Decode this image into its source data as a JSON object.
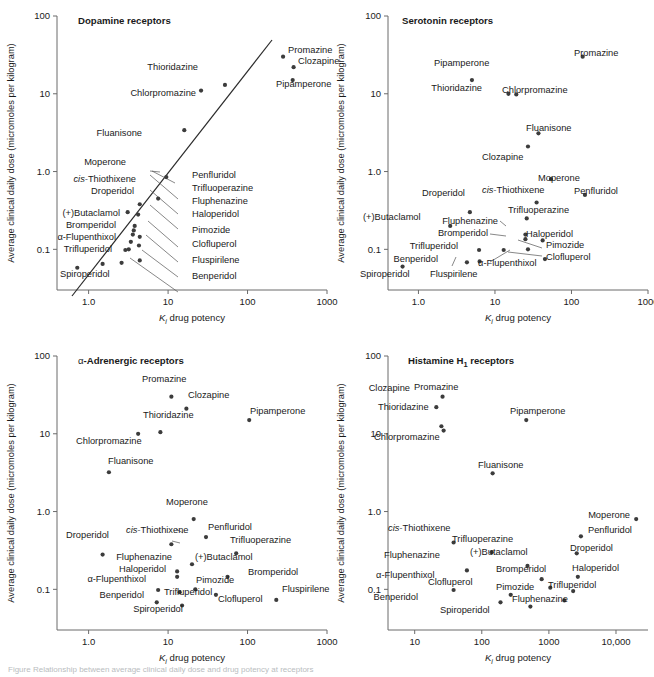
{
  "figure": {
    "axis_y_label": "Average clinical daily dose (micromoles per kilogram)",
    "axis_x_label_prefix": "K",
    "axis_x_label_sub": "i",
    "axis_x_label_suffix": " drug potency",
    "caption": "Figure   Relationship between average clinical daily dose and drug potency at receptors",
    "point_color": "#3c3c3c",
    "axis_color": "#6b6b6b",
    "text_color": "#1a1a1a"
  },
  "chart_data": [
    {
      "type": "scatter",
      "panel_id": "dopamine",
      "title": "Dopamine receptors",
      "xlabel": "Ki drug potency",
      "ylabel": "Average clinical daily dose (micromoles per kilogram)",
      "xlim": [
        0.4,
        1000
      ],
      "ylim": [
        0.03,
        100
      ],
      "xscale": "log",
      "yscale": "log",
      "xticks": [
        "1.0",
        "10",
        "100",
        "1000"
      ],
      "xtick_values": [
        1,
        10,
        100,
        1000
      ],
      "yticks": [
        "100",
        "10",
        "1.0",
        "0.1"
      ],
      "ytick_values": [
        100,
        10,
        1,
        0.1
      ],
      "grid": false,
      "has_regression_line": true,
      "regression_note": "Diagonal best-fit line from lower-left to upper-right",
      "points": [
        {
          "label": "Promazine",
          "x": 280,
          "y": 30,
          "lbl_pos": "right"
        },
        {
          "label": "Clozapine",
          "x": 380,
          "y": 22,
          "lbl_pos": "right"
        },
        {
          "label": "Pipamperone",
          "x": 370,
          "y": 15,
          "lbl_pos": "below-right"
        },
        {
          "label": "Thioridazine",
          "x": 52,
          "y": 13,
          "lbl_pos": "above-left"
        },
        {
          "label": "Chlorpromazine",
          "x": 26,
          "y": 11,
          "lbl_pos": "below-left"
        },
        {
          "label": "Fluanisone",
          "x": 16,
          "y": 3.4,
          "lbl_pos": "below-left"
        },
        {
          "label": "Moperone",
          "x": 9.5,
          "y": 0.85,
          "lbl_pos": "above-left"
        },
        {
          "label": "Penfluridol",
          "x": 7.5,
          "y": 0.45,
          "lbl_pos": "leader-right"
        },
        {
          "label": "cis-Thiothixene",
          "x": 4.4,
          "y": 0.38,
          "lbl_pos": "leader-left"
        },
        {
          "label": "Droperidol",
          "x": 4.2,
          "y": 0.28,
          "lbl_pos": "leader-left"
        },
        {
          "label": "(+)Butaclamol",
          "x": 3.1,
          "y": 0.3,
          "lbl_pos": "leader-left"
        },
        {
          "label": "Trifluoperazine",
          "x": 3.8,
          "y": 0.2,
          "lbl_pos": "leader-right"
        },
        {
          "label": "Bromperidol",
          "x": 3.7,
          "y": 0.175,
          "lbl_pos": "leader-left"
        },
        {
          "label": "Fluphenazine",
          "x": 3.6,
          "y": 0.155,
          "lbl_pos": "leader-right"
        },
        {
          "label": "Haloperidol",
          "x": 4.4,
          "y": 0.145,
          "lbl_pos": "leader-right"
        },
        {
          "label": "alpha-Flupenthixol",
          "x": 3.4,
          "y": 0.125,
          "lbl_pos": "leader-left"
        },
        {
          "label": "Pimozide",
          "x": 4.3,
          "y": 0.112,
          "lbl_pos": "leader-right"
        },
        {
          "label": "Trifluperidol",
          "x": 2.9,
          "y": 0.098,
          "lbl_pos": "leader-left"
        },
        {
          "label": "Clofluperol",
          "x": 3.2,
          "y": 0.1,
          "lbl_pos": "leader-right"
        },
        {
          "label": "Fluspirilene",
          "x": 4.4,
          "y": 0.072,
          "lbl_pos": "leader-right"
        },
        {
          "label": "Benperidol",
          "x": 2.6,
          "y": 0.067,
          "lbl_pos": "leader-right"
        },
        {
          "label": "Spiroperidol",
          "x": 0.72,
          "y": 0.058,
          "lbl_pos": "below"
        },
        {
          "label": "Fluspirilene-b",
          "x": 1.5,
          "y": 0.065,
          "lbl_pos": "none"
        }
      ]
    },
    {
      "type": "scatter",
      "panel_id": "serotonin",
      "title": "Serotonin receptors",
      "xlabel": "Ki drug potency",
      "ylabel": "Average clinical daily dose (micromoles per kilogram)",
      "xlim": [
        0.4,
        1000
      ],
      "ylim": [
        0.03,
        100
      ],
      "xscale": "log",
      "yscale": "log",
      "xticks": [
        "1.0",
        "10",
        "100",
        "1000"
      ],
      "xtick_values": [
        1,
        10,
        100,
        1000
      ],
      "yticks": [
        "100",
        "10",
        "1.0",
        "0.1"
      ],
      "ytick_values": [
        100,
        10,
        1,
        0.1
      ],
      "grid": false,
      "has_regression_line": false,
      "points": [
        {
          "label": "Promazine",
          "x": 140,
          "y": 30,
          "lbl_pos": "right"
        },
        {
          "label": "Pipamperone",
          "x": 5.0,
          "y": 15,
          "lbl_pos": "above"
        },
        {
          "label": "Thioridazine",
          "x": 15,
          "y": 10,
          "lbl_pos": "left"
        },
        {
          "label": "Chlorpromazine",
          "x": 19,
          "y": 9.8,
          "lbl_pos": "right"
        },
        {
          "label": "Fluanisone",
          "x": 37,
          "y": 3.1,
          "lbl_pos": "right"
        },
        {
          "label": "Clozapine",
          "x": 27,
          "y": 2.1,
          "lbl_pos": "below-left"
        },
        {
          "label": "Moperone",
          "x": 54,
          "y": 0.8,
          "lbl_pos": "right"
        },
        {
          "label": "Penfluridol",
          "x": 150,
          "y": 0.5,
          "lbl_pos": "right"
        },
        {
          "label": "cis-Thiothixene",
          "x": 35,
          "y": 0.4,
          "lbl_pos": "above"
        },
        {
          "label": "Droperidol",
          "x": 4.7,
          "y": 0.3,
          "lbl_pos": "above-left"
        },
        {
          "label": "Trifluoperazine",
          "x": 26,
          "y": 0.25,
          "lbl_pos": "right"
        },
        {
          "label": "(+)Butaclamol",
          "x": 2.6,
          "y": 0.2,
          "lbl_pos": "left"
        },
        {
          "label": "Fluphenazine",
          "x": 25,
          "y": 0.155,
          "lbl_pos": "leader-left"
        },
        {
          "label": "Bromperidol",
          "x": 25,
          "y": 0.135,
          "lbl_pos": "leader-left"
        },
        {
          "label": "Haloperidol",
          "x": 42,
          "y": 0.13,
          "lbl_pos": "right"
        },
        {
          "label": "Pimozide",
          "x": 27,
          "y": 0.1,
          "lbl_pos": "leader-right"
        },
        {
          "label": "Trifluperidol",
          "x": 6.2,
          "y": 0.098,
          "lbl_pos": "left"
        },
        {
          "label": "alpha-Flupenthixol",
          "x": 13,
          "y": 0.098,
          "lbl_pos": "leader-below"
        },
        {
          "label": "Clofluperol",
          "x": 45,
          "y": 0.075,
          "lbl_pos": "leader-right"
        },
        {
          "label": "Fluspirilene",
          "x": 6.3,
          "y": 0.07,
          "lbl_pos": "leader-below"
        },
        {
          "label": "Benperidol",
          "x": 4.3,
          "y": 0.068,
          "lbl_pos": "left"
        },
        {
          "label": "Spiroperidol",
          "x": 0.62,
          "y": 0.06,
          "lbl_pos": "below"
        }
      ]
    },
    {
      "type": "scatter",
      "panel_id": "alpha-adrenergic",
      "title": "α-Adrenergic receptors",
      "xlabel": "Ki drug potency",
      "ylabel": "Average clinical daily dose (micromoles per kilogram)",
      "xlim": [
        0.4,
        1000
      ],
      "ylim": [
        0.03,
        100
      ],
      "xscale": "log",
      "yscale": "log",
      "xticks": [
        "1.0",
        "10",
        "100",
        "1000"
      ],
      "xtick_values": [
        1,
        10,
        100,
        1000
      ],
      "yticks": [
        "100",
        "10",
        "1.0",
        "0.1"
      ],
      "ytick_values": [
        100,
        10,
        1,
        0.1
      ],
      "grid": false,
      "has_regression_line": false,
      "points": [
        {
          "label": "Promazine",
          "x": 11,
          "y": 30,
          "lbl_pos": "above"
        },
        {
          "label": "Clozapine",
          "x": 17,
          "y": 21,
          "lbl_pos": "right"
        },
        {
          "label": "Pipamperone",
          "x": 105,
          "y": 15,
          "lbl_pos": "right"
        },
        {
          "label": "Thioridazine",
          "x": 8.0,
          "y": 10.5,
          "lbl_pos": "above"
        },
        {
          "label": "Chlorpromazine",
          "x": 4.2,
          "y": 10,
          "lbl_pos": "below-left"
        },
        {
          "label": "Fluanisone",
          "x": 1.8,
          "y": 3.2,
          "lbl_pos": "right"
        },
        {
          "label": "Moperone",
          "x": 21,
          "y": 0.8,
          "lbl_pos": "above"
        },
        {
          "label": "Penfluridol",
          "x": 30,
          "y": 0.47,
          "lbl_pos": "right"
        },
        {
          "label": "cis-Thiothixene",
          "x": 11,
          "y": 0.38,
          "lbl_pos": "above"
        },
        {
          "label": "Trifluoperazine",
          "x": 72,
          "y": 0.29,
          "lbl_pos": "right"
        },
        {
          "label": "Droperidol",
          "x": 1.5,
          "y": 0.28,
          "lbl_pos": "above"
        },
        {
          "label": "(+)Butaclamol",
          "x": 20,
          "y": 0.21,
          "lbl_pos": "right"
        },
        {
          "label": "Fluphenazine",
          "x": 13,
          "y": 0.17,
          "lbl_pos": "leader-left"
        },
        {
          "label": "Haloperidol",
          "x": 13,
          "y": 0.145,
          "lbl_pos": "leader-left"
        },
        {
          "label": "Bromperidol",
          "x": 56,
          "y": 0.145,
          "lbl_pos": "right"
        },
        {
          "label": "Pimozide",
          "x": 22,
          "y": 0.1,
          "lbl_pos": "right"
        },
        {
          "label": "alpha-Flupenthixol",
          "x": 7.5,
          "y": 0.098,
          "lbl_pos": "left"
        },
        {
          "label": "Clofluperol",
          "x": 40,
          "y": 0.085,
          "lbl_pos": "below"
        },
        {
          "label": "Trifluperidol",
          "x": 14,
          "y": 0.092,
          "lbl_pos": "below-right"
        },
        {
          "label": "Fluspirilene",
          "x": 230,
          "y": 0.073,
          "lbl_pos": "right"
        },
        {
          "label": "Benperidol",
          "x": 7.2,
          "y": 0.068,
          "lbl_pos": "left"
        },
        {
          "label": "Spiroperidol",
          "x": 15,
          "y": 0.062,
          "lbl_pos": "below"
        }
      ]
    },
    {
      "type": "scatter",
      "panel_id": "histamine-h1",
      "title": "Histamine H1 receptors",
      "title_main": "Histamine H",
      "title_sub": "1",
      "title_tail": " receptors",
      "xlabel": "Ki drug potency",
      "ylabel": "Average clinical daily dose (micromoles per kilogram)",
      "xlim": [
        4,
        30000
      ],
      "ylim": [
        0.03,
        100
      ],
      "xscale": "log",
      "yscale": "log",
      "xticks": [
        "10",
        "100",
        "1000",
        "10,000"
      ],
      "xtick_values": [
        10,
        100,
        1000,
        10000
      ],
      "yticks": [
        "100",
        "10",
        "1.0",
        "0.1"
      ],
      "ytick_values": [
        100,
        10,
        1,
        0.1
      ],
      "grid": false,
      "has_regression_line": false,
      "points": [
        {
          "label": "Promazine",
          "x": 26,
          "y": 30,
          "lbl_pos": "right"
        },
        {
          "label": "Clozapine",
          "x": 21,
          "y": 22,
          "lbl_pos": "above-left"
        },
        {
          "label": "Pipamperone",
          "x": 460,
          "y": 15,
          "lbl_pos": "right"
        },
        {
          "label": "Thioridazine",
          "x": 25,
          "y": 12.5,
          "lbl_pos": "above"
        },
        {
          "label": "Chlorpromazine",
          "x": 27,
          "y": 11,
          "lbl_pos": "below-left"
        },
        {
          "label": "Fluanisone",
          "x": 145,
          "y": 3.1,
          "lbl_pos": "right"
        },
        {
          "label": "Moperone",
          "x": 20000,
          "y": 0.8,
          "lbl_pos": "left"
        },
        {
          "label": "Penfluridol",
          "x": 3000,
          "y": 0.48,
          "lbl_pos": "right"
        },
        {
          "label": "cis-Thiothixene",
          "x": 38,
          "y": 0.4,
          "lbl_pos": "above"
        },
        {
          "label": "Trifluoperazine",
          "x": 140,
          "y": 0.3,
          "lbl_pos": "above"
        },
        {
          "label": "Droperidol",
          "x": 2600,
          "y": 0.29,
          "lbl_pos": "right"
        },
        {
          "label": "(+)Butaclamol",
          "x": 480,
          "y": 0.2,
          "lbl_pos": "above-right"
        },
        {
          "label": "Fluphenazine",
          "x": 60,
          "y": 0.175,
          "lbl_pos": "above-left"
        },
        {
          "label": "Haloperidol",
          "x": 2700,
          "y": 0.145,
          "lbl_pos": "right"
        },
        {
          "label": "Bromperidol",
          "x": 780,
          "y": 0.135,
          "lbl_pos": "left"
        },
        {
          "label": "Pimozide",
          "x": 1050,
          "y": 0.105,
          "lbl_pos": "below-left"
        },
        {
          "label": "alpha-Flupenthixol",
          "x": 38,
          "y": 0.098,
          "lbl_pos": "above-left"
        },
        {
          "label": "Trifluperidol",
          "x": 2300,
          "y": 0.095,
          "lbl_pos": "right"
        },
        {
          "label": "Clofluperol",
          "x": 270,
          "y": 0.085,
          "lbl_pos": "left"
        },
        {
          "label": "Fluphenazine-2",
          "x": 1700,
          "y": 0.072,
          "lbl_pos": "below-right"
        },
        {
          "label": "Benperidol",
          "x": 190,
          "y": 0.068,
          "lbl_pos": "left"
        },
        {
          "label": "Spiroperidol",
          "x": 530,
          "y": 0.06,
          "lbl_pos": "below"
        }
      ]
    }
  ]
}
